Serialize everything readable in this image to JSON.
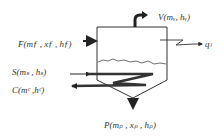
{
  "diagram": {
    "type": "evaporator-schematic",
    "labels": {
      "vapor": "V(mᵥ, hᵥ)",
      "feed": "F(mƒ , xƒ , hƒ)",
      "steam": "S(mₛ , hₛ)",
      "condensate": "C(mᶜ ,hᶜ)",
      "product": "P(mₚ , xₚ , hₚ)",
      "heat_loss": "qₗ"
    },
    "streams": [
      {
        "id": "V",
        "name": "Vapor outlet",
        "direction": "out",
        "position": "top"
      },
      {
        "id": "F",
        "name": "Feed inlet",
        "direction": "in",
        "position": "left-upper"
      },
      {
        "id": "S",
        "name": "Steam inlet",
        "direction": "in",
        "position": "left-coil"
      },
      {
        "id": "C",
        "name": "Condensate outlet",
        "direction": "out",
        "position": "left-coil"
      },
      {
        "id": "P",
        "name": "Product outlet",
        "direction": "out",
        "position": "bottom"
      },
      {
        "id": "qL",
        "name": "Heat loss",
        "direction": "out",
        "position": "right"
      }
    ],
    "colors": {
      "line": "#222222",
      "text": "#333333",
      "background": "#ffffff"
    }
  }
}
